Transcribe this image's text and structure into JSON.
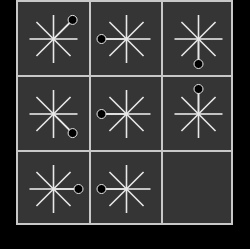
{
  "puzzle": {
    "grid": {
      "rows": 3,
      "cols": 3
    },
    "colors": {
      "background": "#000000",
      "board": "#353535",
      "lines": "#c8c8c8",
      "star": "#e8e8e8",
      "dot": "#000000",
      "dot_outline": "#e8e8e8"
    },
    "cells": [
      {
        "row": 0,
        "col": 0,
        "icon": "star-8-spoke",
        "dot_direction": "NE"
      },
      {
        "row": 0,
        "col": 1,
        "icon": "star-8-spoke",
        "dot_direction": "W"
      },
      {
        "row": 0,
        "col": 2,
        "icon": "star-8-spoke",
        "dot_direction": "S"
      },
      {
        "row": 1,
        "col": 0,
        "icon": "star-8-spoke",
        "dot_direction": "SE"
      },
      {
        "row": 1,
        "col": 1,
        "icon": "star-8-spoke",
        "dot_direction": "W"
      },
      {
        "row": 1,
        "col": 2,
        "icon": "star-8-spoke",
        "dot_direction": "N"
      },
      {
        "row": 2,
        "col": 0,
        "icon": "star-8-spoke",
        "dot_direction": "E"
      },
      {
        "row": 2,
        "col": 1,
        "icon": "star-8-spoke",
        "dot_direction": "W"
      },
      {
        "row": 2,
        "col": 2,
        "icon": "empty",
        "dot_direction": null
      }
    ]
  }
}
